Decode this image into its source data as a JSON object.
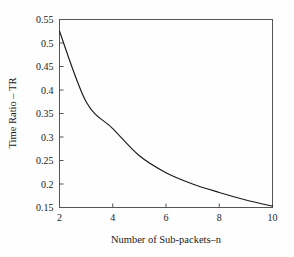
{
  "figure": {
    "background_color": "#fefefe",
    "curve_color": "#1a1a1a",
    "axis_color": "#555555"
  },
  "chart_data": {
    "type": "line",
    "title": "",
    "subtitle": "",
    "xlabel": "Number of Sub-packets–n",
    "ylabel": "Time Ratio – TR",
    "xlim": [
      2,
      10
    ],
    "ylim": [
      0.15,
      0.55
    ],
    "grid": false,
    "legend": null,
    "xticks": [
      2,
      4,
      6,
      8,
      10
    ],
    "xtick_labels": [
      "2",
      "4",
      "6",
      "8",
      "10"
    ],
    "yticks": [
      0.15,
      0.2,
      0.25,
      0.3,
      0.35,
      0.4,
      0.45,
      0.5,
      0.55
    ],
    "ytick_labels": [
      "0.15",
      "0.2",
      "0.25",
      "0.3",
      "0.35",
      "0.4",
      "0.45",
      "0.5",
      "0.55"
    ],
    "series": [
      {
        "name": "Time Ratio",
        "x": [
          2,
          3,
          4,
          5,
          6,
          7,
          8,
          9,
          10
        ],
        "values": [
          0.525,
          0.375,
          0.318,
          0.26,
          0.224,
          0.2,
          0.182,
          0.166,
          0.153
        ]
      }
    ]
  }
}
